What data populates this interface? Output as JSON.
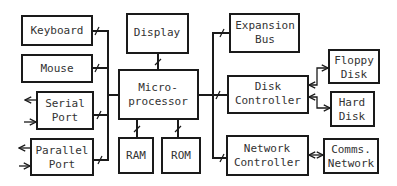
{
  "diagram": {
    "type": "block-diagram",
    "blocks": {
      "keyboard": {
        "label": [
          "Keyboard"
        ]
      },
      "mouse": {
        "label": [
          "Mouse"
        ]
      },
      "serial_port": {
        "label": [
          "Serial",
          "Port"
        ]
      },
      "parallel_port": {
        "label": [
          "Parallel",
          "Port"
        ]
      },
      "display": {
        "label": [
          "Display"
        ]
      },
      "microprocessor": {
        "label": [
          "Micro-",
          "processor"
        ]
      },
      "ram": {
        "label": [
          "RAM"
        ]
      },
      "rom": {
        "label": [
          "ROM"
        ]
      },
      "expansion_bus": {
        "label": [
          "Expansion",
          "Bus"
        ]
      },
      "disk_controller": {
        "label": [
          "Disk",
          "Controller"
        ]
      },
      "network_controller": {
        "label": [
          "Network",
          "Controller"
        ]
      },
      "floppy_disk": {
        "label": [
          "Floppy",
          "Disk"
        ]
      },
      "hard_disk": {
        "label": [
          "Hard",
          "Disk"
        ]
      },
      "comms_network": {
        "label": [
          "Comms.",
          "Network"
        ]
      }
    },
    "connections": [
      {
        "from": "keyboard",
        "to": "left-bus",
        "type": "bus"
      },
      {
        "from": "mouse",
        "to": "left-bus",
        "type": "bus"
      },
      {
        "from": "serial_port",
        "to": "left-bus",
        "type": "bus"
      },
      {
        "from": "parallel_port",
        "to": "left-bus",
        "type": "bus"
      },
      {
        "from": "left-bus",
        "to": "microprocessor",
        "type": "bus"
      },
      {
        "from": "microprocessor",
        "to": "display",
        "type": "bus"
      },
      {
        "from": "microprocessor",
        "to": "ram",
        "type": "bus"
      },
      {
        "from": "microprocessor",
        "to": "rom",
        "type": "bus"
      },
      {
        "from": "microprocessor",
        "to": "right-bus",
        "type": "bus"
      },
      {
        "from": "right-bus",
        "to": "expansion_bus",
        "type": "bus"
      },
      {
        "from": "right-bus",
        "to": "disk_controller",
        "type": "bus"
      },
      {
        "from": "right-bus",
        "to": "network_controller",
        "type": "bus"
      },
      {
        "from": "disk_controller",
        "to": "floppy_disk",
        "type": "bidirectional"
      },
      {
        "from": "disk_controller",
        "to": "hard_disk",
        "type": "bidirectional"
      },
      {
        "from": "network_controller",
        "to": "comms_network",
        "type": "bidirectional"
      },
      {
        "from": "serial_port",
        "to": "external",
        "type": "in-out arrows"
      },
      {
        "from": "parallel_port",
        "to": "external",
        "type": "in-out arrows"
      }
    ]
  }
}
